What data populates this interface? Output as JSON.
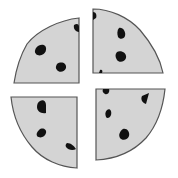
{
  "illustration": {
    "subject": "round cookie cut into four quarters",
    "piece_count": 4,
    "colors": {
      "background": "#ffffff",
      "piece_fill": "#d4d4d4",
      "piece_outline": "#555555",
      "chip": "#111111"
    },
    "pieces": [
      {
        "name": "top-left",
        "chips": 3
      },
      {
        "name": "top-right",
        "chips": 3
      },
      {
        "name": "bottom-left",
        "chips": 3
      },
      {
        "name": "bottom-right",
        "chips": 4
      }
    ]
  }
}
